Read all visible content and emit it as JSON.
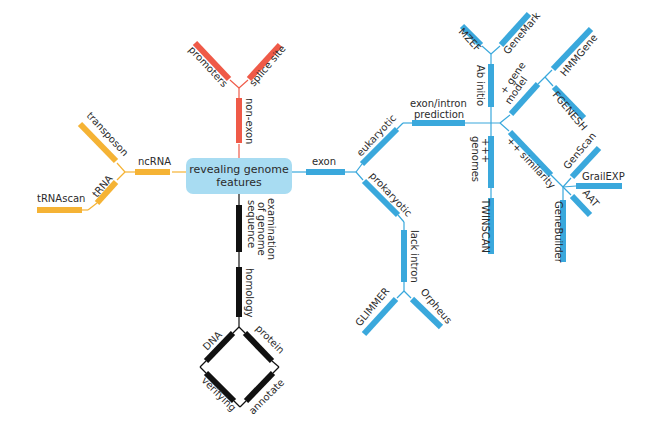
{
  "center": {
    "line1": "revealing genome",
    "line2": "features",
    "color": "#a8dcf2"
  },
  "colors": {
    "ncrna": "#f5b335",
    "nonexon": "#ef5a48",
    "homology": "#111111",
    "exon": "#3aa8dc"
  },
  "ncrna_branch": {
    "root": "ncRNA",
    "children": [
      "transposon",
      "tRNA"
    ],
    "tRNA_child": "tRNAscan"
  },
  "nonexon_branch": {
    "root": "non-exon",
    "children": [
      "promoters",
      "splice site"
    ]
  },
  "homology_branch": {
    "root_line1": "examination",
    "root_line2": "of genome",
    "root_line3": "sequence",
    "mid": "homology",
    "diamond": [
      "DNA",
      "protein",
      "verifying",
      "annotate"
    ]
  },
  "exon_branch": {
    "root": "exon",
    "eukaryotic": "eukaryotic",
    "prokaryotic": "prokaryotic",
    "prediction_line1": "exon/intron",
    "prediction_line2": "prediction",
    "ab_initio": "Ab initio",
    "ab_initio_children": [
      "MZEF",
      "GeneMark"
    ],
    "gene_model_line1": "+ gene",
    "gene_model_line2": "model",
    "gene_model_children": [
      "HMMGene",
      "FGENESH"
    ],
    "genomes_line1": "+++",
    "genomes_line2": "genomes",
    "genomes_child": "TWINSCAN",
    "similarity": "++ similarity",
    "similarity_children": [
      "GenScan",
      "GrailEXP",
      "AAT",
      "GeneBuilder"
    ],
    "lack_intron": "lack intron",
    "lack_intron_children": [
      "GLIMMER",
      "Orpheus"
    ]
  }
}
